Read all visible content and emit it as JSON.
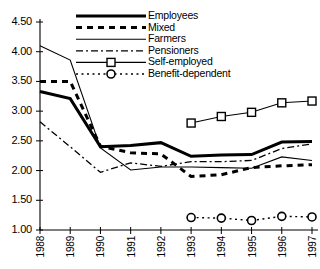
{
  "chart_data": {
    "type": "line",
    "title": "",
    "subtitle": "",
    "xlabel": "",
    "ylabel": "",
    "categories": [
      "1988",
      "1989",
      "1990",
      "1991",
      "1992",
      "1993",
      "1994",
      "1995",
      "1996",
      "1997"
    ],
    "xlim": [
      "1988",
      "1997"
    ],
    "ylim": [
      1.0,
      4.5
    ],
    "ytick_labels": [
      "4.50",
      "4.00",
      "3.50",
      "3.00",
      "2.50",
      "2.00",
      "1.50",
      "1.00"
    ],
    "ytick_values": [
      4.5,
      4.0,
      3.5,
      3.0,
      2.5,
      2.0,
      1.5,
      1.0
    ],
    "grid": false,
    "legend_position": "top-center",
    "series": [
      {
        "name": "Employees",
        "style": "thick-solid",
        "marker": "none",
        "x": [
          "1988",
          "1989",
          "1990",
          "1991",
          "1992",
          "1993",
          "1994",
          "1995",
          "1996",
          "1997"
        ],
        "values": [
          3.33,
          3.21,
          2.4,
          2.42,
          2.47,
          2.24,
          2.26,
          2.27,
          2.48,
          2.49
        ]
      },
      {
        "name": "Mixed",
        "style": "thick-dashed",
        "marker": "none",
        "x": [
          "1988",
          "1989",
          "1990",
          "1991",
          "1992",
          "1993",
          "1994",
          "1995",
          "1996",
          "1997"
        ],
        "values": [
          3.5,
          3.5,
          2.41,
          2.3,
          2.28,
          1.9,
          1.93,
          2.05,
          2.08,
          2.1
        ]
      },
      {
        "name": "Farmers",
        "style": "thin-solid",
        "marker": "none",
        "x": [
          "1988",
          "1989",
          "1990",
          "1991",
          "1992",
          "1993",
          "1994",
          "1995",
          "1996",
          "1997"
        ],
        "values": [
          4.1,
          3.86,
          2.38,
          2.01,
          2.06,
          2.06,
          2.05,
          2.04,
          2.23,
          2.17
        ]
      },
      {
        "name": "Pensioners",
        "style": "dash-dot",
        "marker": "none",
        "x": [
          "1988",
          "1989",
          "1990",
          "1991",
          "1992",
          "1993",
          "1994",
          "1995",
          "1996",
          "1997"
        ],
        "values": [
          2.82,
          2.4,
          1.97,
          2.13,
          2.07,
          2.15,
          2.15,
          2.17,
          2.37,
          2.45
        ]
      },
      {
        "name": "Self-employed",
        "style": "thin-solid-marker",
        "marker": "square",
        "x": [
          "1993",
          "1994",
          "1995",
          "1996",
          "1997"
        ],
        "values": [
          2.8,
          2.91,
          2.98,
          3.14,
          3.17
        ]
      },
      {
        "name": "Benefit-dependent",
        "style": "dotted-marker",
        "marker": "circle",
        "x": [
          "1993",
          "1994",
          "1995",
          "1996",
          "1997"
        ],
        "values": [
          1.21,
          1.2,
          1.16,
          1.23,
          1.22
        ]
      }
    ]
  },
  "legend": {
    "items": [
      {
        "label": "Employees"
      },
      {
        "label": "Mixed"
      },
      {
        "label": "Farmers"
      },
      {
        "label": "Pensioners"
      },
      {
        "label": "Self-employed"
      },
      {
        "label": "Benefit-dependent"
      }
    ]
  },
  "colors": {
    "line": "#000000",
    "axis": "#000000",
    "background": "#ffffff"
  }
}
